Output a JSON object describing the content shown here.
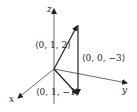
{
  "diagram": {
    "axes": {
      "x_label": "x",
      "y_label": "y",
      "z_label": "z"
    },
    "vectors": [
      {
        "label": "⟨0, 1, 2⟩",
        "from": [
          0,
          0,
          0
        ],
        "to": [
          0,
          1,
          2
        ]
      },
      {
        "label": "⟨0, 1, −1⟩",
        "from": [
          0,
          0,
          0
        ],
        "to": [
          0,
          1,
          -1
        ]
      },
      {
        "label": "⟨0, 0, −3⟩",
        "from": [
          0,
          1,
          2
        ],
        "to": [
          0,
          1,
          -1
        ]
      }
    ],
    "colors": {
      "ink": "#222222",
      "axis": "#444444",
      "background": "#ffffff"
    }
  }
}
